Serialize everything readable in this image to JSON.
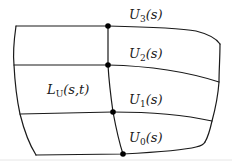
{
  "diagram": {
    "type": "parametric surface patch (loft through curves)",
    "surface_label": {
      "main": "L",
      "sub": "U",
      "args": "(s,t)"
    },
    "curves": [
      {
        "id": "U3",
        "main": "U",
        "sub": "3",
        "args": "(s)"
      },
      {
        "id": "U2",
        "main": "U",
        "sub": "2",
        "args": "(s)"
      },
      {
        "id": "U1",
        "main": "U",
        "sub": "1",
        "args": "(s)"
      },
      {
        "id": "U0",
        "main": "U",
        "sub": "0",
        "args": "(s)"
      }
    ],
    "colors": {
      "stroke": "#1a1a1a",
      "dot": "#000000",
      "background": "#ffffff"
    }
  }
}
